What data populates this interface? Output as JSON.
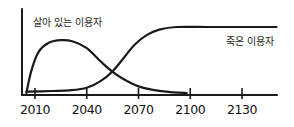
{
  "chart_data": {
    "type": "line",
    "title": "",
    "xlabel": "",
    "ylabel": "",
    "style": "hand-drawn sketch, black ink on white",
    "grid": false,
    "legend": "inline labels",
    "x_ticks": [
      2010,
      2040,
      2070,
      2100,
      2130
    ],
    "xlim": [
      2003,
      2150
    ],
    "ylim": [
      0,
      100
    ],
    "y_ticks": [],
    "series": [
      {
        "name": "살아 있는 이용자",
        "label_position": {
          "x": 2008,
          "y": 88
        },
        "points": [
          {
            "x": 2005,
            "y": 0
          },
          {
            "x": 2008,
            "y": 35
          },
          {
            "x": 2012,
            "y": 62
          },
          {
            "x": 2018,
            "y": 76
          },
          {
            "x": 2025,
            "y": 80
          },
          {
            "x": 2032,
            "y": 78
          },
          {
            "x": 2040,
            "y": 68
          },
          {
            "x": 2048,
            "y": 48
          },
          {
            "x": 2055,
            "y": 32
          },
          {
            "x": 2062,
            "y": 20
          },
          {
            "x": 2070,
            "y": 10
          },
          {
            "x": 2080,
            "y": 4
          },
          {
            "x": 2090,
            "y": 1
          },
          {
            "x": 2098,
            "y": 0
          }
        ]
      },
      {
        "name": "죽은 이용자",
        "label_position": {
          "x": 2118,
          "y": 72
        },
        "points": [
          {
            "x": 2005,
            "y": 2
          },
          {
            "x": 2020,
            "y": 3
          },
          {
            "x": 2030,
            "y": 4
          },
          {
            "x": 2040,
            "y": 8
          },
          {
            "x": 2048,
            "y": 18
          },
          {
            "x": 2055,
            "y": 33
          },
          {
            "x": 2062,
            "y": 55
          },
          {
            "x": 2068,
            "y": 74
          },
          {
            "x": 2075,
            "y": 88
          },
          {
            "x": 2082,
            "y": 96
          },
          {
            "x": 2092,
            "y": 100
          },
          {
            "x": 2110,
            "y": 100
          },
          {
            "x": 2130,
            "y": 100
          },
          {
            "x": 2150,
            "y": 100
          }
        ]
      }
    ]
  },
  "labels": {
    "living_users": "살아 있는 이용자",
    "dead_users": "죽은 이용자"
  }
}
